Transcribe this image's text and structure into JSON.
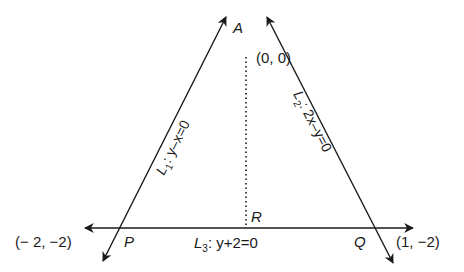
{
  "diagram": {
    "type": "triangle-lines",
    "colors": {
      "line": "#1a1a1a",
      "background": "#ffffff"
    },
    "vertices": {
      "A": {
        "label": "A",
        "coord": "(0, 0)"
      },
      "P": {
        "label": "P",
        "coord": "(− 2, −2)"
      },
      "Q": {
        "label": "Q",
        "coord": "(1, −2)"
      },
      "R": {
        "label": "R"
      }
    },
    "lines": {
      "L1": {
        "name": "L",
        "sub": "1",
        "eq": ": y–x=0"
      },
      "L2": {
        "name": "L",
        "sub": "2",
        "eq": ": 2x–y=0"
      },
      "L3": {
        "name": "L",
        "sub": "3",
        "eq": ": y+2=0"
      }
    }
  }
}
